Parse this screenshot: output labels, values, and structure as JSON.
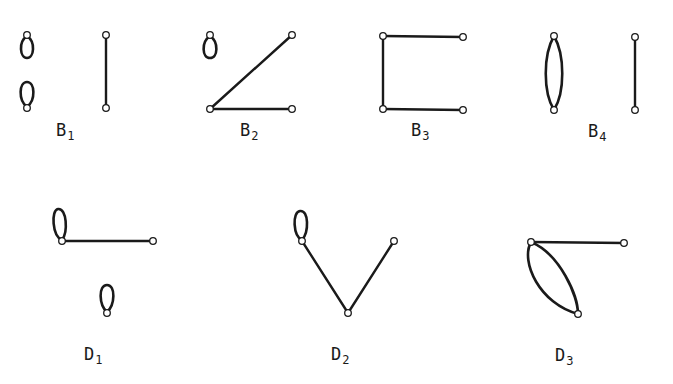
{
  "figure": {
    "graphs": [
      {
        "id": "B1",
        "label_main": "B",
        "label_sub": "1",
        "description": "two disjoint single-vertex loops and one isolated edge"
      },
      {
        "id": "B2",
        "label_main": "B",
        "label_sub": "2",
        "description": "single-vertex loop plus a path of two edges forming an angle"
      },
      {
        "id": "B3",
        "label_main": "B",
        "label_sub": "3",
        "description": "path of three edges forming a bracket shape"
      },
      {
        "id": "B4",
        "label_main": "B",
        "label_sub": "4",
        "description": "double edge between two vertices plus an isolated edge"
      },
      {
        "id": "D1",
        "label_main": "D",
        "label_sub": "1",
        "description": "edge with a loop at one end plus a separate single-vertex loop"
      },
      {
        "id": "D2",
        "label_main": "D",
        "label_sub": "2",
        "description": "V-shaped path of two edges with a loop at the upper-left vertex"
      },
      {
        "id": "D3",
        "label_main": "D",
        "label_sub": "3",
        "description": "edge plus a double edge sharing a common vertex"
      }
    ]
  }
}
